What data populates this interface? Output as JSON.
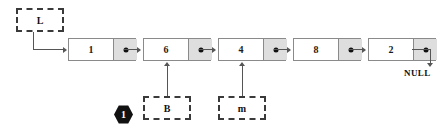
{
  "diagram": {
    "head_pointer": {
      "label": "L"
    },
    "nodes": [
      {
        "value": "1"
      },
      {
        "value": "6"
      },
      {
        "value": "4"
      },
      {
        "value": "8"
      },
      {
        "value": "2"
      }
    ],
    "pointer_boxes": [
      {
        "label": "B",
        "points_to_node_value": "6"
      },
      {
        "label": "m",
        "points_to_node_value": "4"
      }
    ],
    "terminator": {
      "label": "NULL"
    },
    "step_badge": {
      "label": "1"
    },
    "colors": {
      "node_border": "#8a8a8a",
      "pointer_cell_fill": "#dedede",
      "data_cell_fill": "#ffffff",
      "dashed_box_border": "#3a3a3a",
      "connector": "#555555",
      "badge_fill": "#111111",
      "badge_text": "#ffffff",
      "background": "#ffffff"
    }
  }
}
